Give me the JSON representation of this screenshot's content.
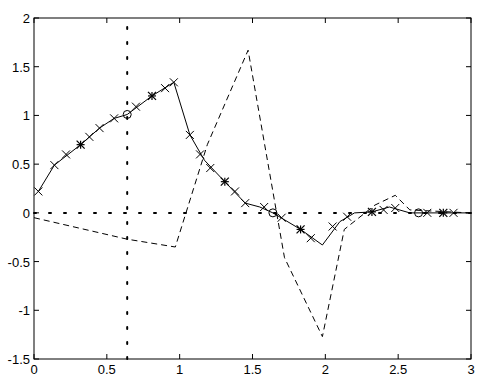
{
  "chart_data": {
    "type": "line",
    "title": "",
    "xlabel": "",
    "ylabel": "",
    "xlim": [
      0,
      3
    ],
    "ylim": [
      -1.5,
      2
    ],
    "grid": false,
    "legend": null,
    "x_ticks": [
      0,
      0.5,
      1,
      1.5,
      2,
      2.5,
      3
    ],
    "x_tick_labels": [
      "0",
      "0.5",
      "1",
      "1.5",
      "2",
      "2.5",
      "3"
    ],
    "y_ticks": [
      -1.5,
      -1,
      -0.5,
      0,
      0.5,
      1,
      1.5,
      2
    ],
    "y_tick_labels": [
      "-1.5",
      "-1",
      "-0.5",
      "0",
      "0.5",
      "1",
      "1.5",
      "2"
    ],
    "series": [
      {
        "name": "solid",
        "style": "solid",
        "color": "#000000",
        "markers": [
          "x",
          "*",
          "o"
        ],
        "x": [
          0.03,
          0.14,
          0.32,
          0.45,
          0.55,
          0.64,
          0.81,
          0.96,
          1.07,
          1.17,
          1.31,
          1.45,
          1.55,
          1.64,
          1.83,
          1.98,
          2.1,
          2.2,
          2.32,
          2.44,
          2.58,
          2.99
        ],
        "y": [
          0.22,
          0.49,
          0.7,
          0.87,
          0.97,
          1.01,
          1.2,
          1.34,
          0.8,
          0.54,
          0.32,
          0.1,
          0.06,
          0.0,
          -0.17,
          -0.33,
          -0.09,
          0.0,
          0.01,
          0.06,
          0.0,
          0.0
        ]
      },
      {
        "name": "dashed",
        "style": "dashed",
        "color": "#000000",
        "x": [
          0.0,
          0.64,
          0.97,
          1.19,
          1.47,
          1.72,
          1.98,
          2.13,
          2.34,
          2.48,
          2.58,
          2.99
        ],
        "y": [
          -0.05,
          -0.27,
          -0.35,
          0.7,
          1.67,
          -0.46,
          -1.27,
          -0.17,
          0.08,
          0.18,
          0.03,
          0.0
        ]
      },
      {
        "name": "horizontal-dotted",
        "style": "dotted",
        "color": "#000000",
        "x": [
          0,
          3
        ],
        "y": [
          0,
          0
        ]
      },
      {
        "name": "vertical-dotted",
        "style": "dotted",
        "color": "#000000",
        "x": [
          0.64,
          0.64
        ],
        "y": [
          -1.5,
          2
        ]
      }
    ],
    "marker_points": {
      "x_markers": [
        [
          0.03,
          0.22
        ],
        [
          0.14,
          0.49
        ],
        [
          0.22,
          0.6
        ],
        [
          0.38,
          0.78
        ],
        [
          0.45,
          0.87
        ],
        [
          0.55,
          0.97
        ],
        [
          0.7,
          1.09
        ],
        [
          0.9,
          1.28
        ],
        [
          0.96,
          1.34
        ],
        [
          1.07,
          0.8
        ],
        [
          1.14,
          0.6
        ],
        [
          1.21,
          0.46
        ],
        [
          1.38,
          0.22
        ],
        [
          1.45,
          0.1
        ],
        [
          1.58,
          0.06
        ],
        [
          1.7,
          -0.05
        ],
        [
          1.9,
          -0.26
        ],
        [
          2.05,
          -0.14
        ],
        [
          2.15,
          -0.04
        ],
        [
          2.4,
          0.03
        ],
        [
          2.48,
          0.05
        ],
        [
          2.7,
          0.0
        ],
        [
          2.88,
          0.0
        ]
      ],
      "star_markers": [
        [
          0.32,
          0.7
        ],
        [
          0.81,
          1.2
        ],
        [
          1.31,
          0.32
        ],
        [
          1.83,
          -0.17
        ],
        [
          2.32,
          0.01
        ],
        [
          2.81,
          0.0
        ]
      ],
      "circle_markers": [
        [
          0.64,
          1.01
        ],
        [
          1.64,
          0.0
        ],
        [
          2.64,
          0.0
        ]
      ]
    }
  }
}
